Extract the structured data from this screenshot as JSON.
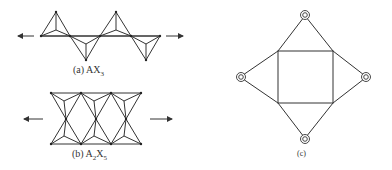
{
  "figure": {
    "panels": [
      {
        "id": "a",
        "caption_prefix": "(a) AX",
        "caption_sub": "3",
        "description": "Chain of corner-sharing tetrahedra, alternating up and down, extending left and right"
      },
      {
        "id": "b",
        "caption_prefix": "(b) A",
        "caption_sub1": "2",
        "caption_mid": "X",
        "caption_sub2": "5",
        "description": "Double chain of tetrahedra forming a ribbon, extending left and right"
      },
      {
        "id": "c",
        "caption": "(c)",
        "description": "Square with four triangular faces pointing outward, each apex marked by a double circle"
      }
    ],
    "colors": {
      "line": "#333333",
      "background": "#ffffff"
    }
  }
}
